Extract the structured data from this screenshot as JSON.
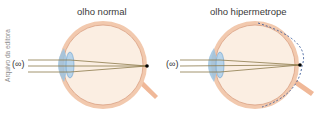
{
  "credit": "Arquivo da editora",
  "panels": [
    {
      "title": "olho normal",
      "infinity_label": "(∞)"
    },
    {
      "title": "olho hipermetrope",
      "infinity_label": "(∞)"
    }
  ],
  "colors": {
    "sclera": "#f2c9ae",
    "eye_fill": "#fbeee2",
    "cornea": "#9cc3e0",
    "rays": "#8b7a4a",
    "focus_point": "#000000",
    "dashed_retina": "#3b5b9a"
  }
}
